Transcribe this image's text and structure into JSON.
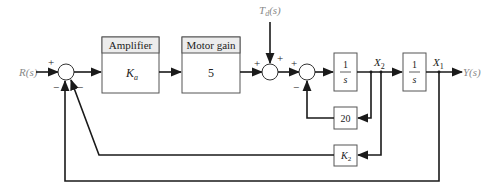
{
  "diagram": {
    "type": "block_diagram",
    "input": {
      "label": "R(s)"
    },
    "output": {
      "label": "Y(s)"
    },
    "disturbance": {
      "label": "T_d(s)",
      "display_main": "T",
      "display_sub": "d",
      "display_rest": "(s)"
    },
    "blocks": {
      "amplifier": {
        "header": "Amplifier",
        "value_main": "K",
        "value_sub": "a"
      },
      "motor_gain": {
        "header": "Motor gain",
        "value": "5"
      },
      "integrator1": {
        "num": "1",
        "den": "s"
      },
      "integrator2": {
        "num": "1",
        "den": "s"
      },
      "feedback_20": {
        "value": "20"
      },
      "feedback_k2": {
        "value_main": "K",
        "value_sub": "2"
      }
    },
    "signals": {
      "x2": {
        "main": "X",
        "sub": "2"
      },
      "x1": {
        "main": "X",
        "sub": "1"
      }
    },
    "summing_junctions": {
      "sum1": {
        "signs": {
          "in_left": "+",
          "in_bottom_left": "−",
          "in_bottom_right": "−"
        }
      },
      "sum2": {
        "signs": {
          "in_left": "+",
          "in_top": "+"
        }
      },
      "sum3": {
        "signs": {
          "in_left": "+",
          "in_bottom": "−"
        }
      }
    },
    "connections": [
      "R(s) -> sum1 (+)",
      "sum1 -> Amplifier K_a",
      "Amplifier -> Motor gain 5",
      "Motor gain -> sum2 (+)",
      "T_d(s) -> sum2 (+)",
      "sum2 -> sum3 (+)",
      "sum3 -> 1/s -> X2",
      "X2 -> 20 -> sum3 (-)",
      "X2 -> K2 -> sum1 (-)",
      "X2 -> 1/s -> X1 = Y(s)",
      "X1 -> sum1 (-)"
    ]
  }
}
